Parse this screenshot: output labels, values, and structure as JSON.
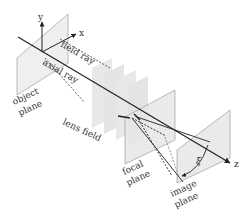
{
  "diagram": {
    "axes": {
      "x": "x",
      "y": "y",
      "z": "z"
    },
    "labels": {
      "field_ray": "field ray",
      "axial_ray": "axial ray",
      "object_plane": [
        "object",
        "plane"
      ],
      "lens_field": "lens field",
      "focal_plane": [
        "focal",
        "plane"
      ],
      "image_plane": [
        "image",
        "plane"
      ],
      "angle": "ξ"
    },
    "colors": {
      "plane_fill": "#e6e6e6",
      "plane_edge": "#a8a8a8",
      "lens_fill": "#e9e9e9",
      "line": "#222222",
      "text": "#333333"
    },
    "lens_element_count": 4
  }
}
